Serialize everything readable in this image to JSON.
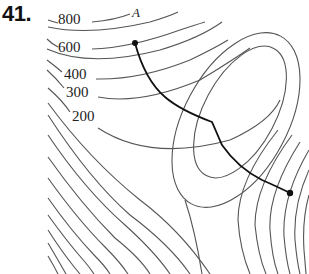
{
  "problem": {
    "number": "41."
  },
  "contour_labels": [
    {
      "value": "800",
      "x": 58,
      "y": 24
    },
    {
      "value": "600",
      "x": 58,
      "y": 52
    },
    {
      "value": "400",
      "x": 64,
      "y": 79
    },
    {
      "value": "300",
      "x": 66,
      "y": 97
    },
    {
      "value": "200",
      "x": 72,
      "y": 121
    }
  ],
  "points": {
    "start": {
      "label": "A",
      "x": 135,
      "y": 43
    },
    "end": {
      "label": "",
      "x": 290,
      "y": 193
    }
  },
  "colors": {
    "contour": "#555555",
    "path": "#111111",
    "background": "#ffffff"
  }
}
